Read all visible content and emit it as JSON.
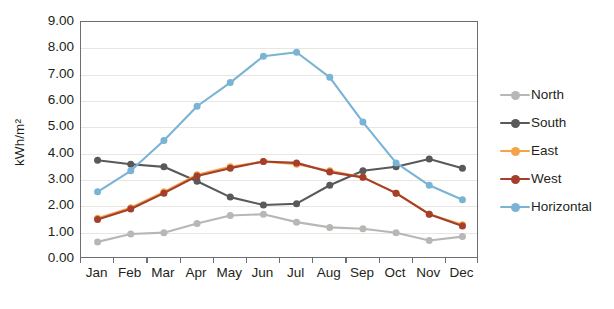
{
  "chart_data": {
    "type": "line",
    "title": "",
    "subtitle": "",
    "xlabel": "",
    "ylabel": "kWh/m²",
    "categories": [
      "Jan",
      "Feb",
      "Mar",
      "Apr",
      "May",
      "Jun",
      "Jul",
      "Aug",
      "Sep",
      "Oct",
      "Nov",
      "Dec"
    ],
    "ylim": [
      0,
      9
    ],
    "ytick_step": 1,
    "ytick_labels": [
      "9.00",
      "8.00",
      "7.00",
      "6.00",
      "5.00",
      "4.00",
      "3.00",
      "2.00",
      "1.00",
      "0.00"
    ],
    "ytick_values": [
      9,
      8,
      7,
      6,
      5,
      4,
      3,
      2,
      1,
      0
    ],
    "grid": true,
    "grid_axis": "y",
    "legend_position": "right",
    "markers": "circle",
    "series": [
      {
        "name": "North",
        "color": "#b7b7b5",
        "values": [
          0.65,
          0.95,
          1.0,
          1.35,
          1.65,
          1.7,
          1.4,
          1.2,
          1.15,
          1.0,
          0.7,
          0.85
        ]
      },
      {
        "name": "South",
        "color": "#58595b",
        "values": [
          3.75,
          3.6,
          3.5,
          2.95,
          2.35,
          2.05,
          2.1,
          2.8,
          3.35,
          3.5,
          3.8,
          3.45
        ]
      },
      {
        "name": "East",
        "color": "#f5a34a",
        "values": [
          1.55,
          1.95,
          2.55,
          3.2,
          3.5,
          3.7,
          3.6,
          3.35,
          3.1,
          2.5,
          1.7,
          1.3
        ]
      },
      {
        "name": "West",
        "color": "#a33f2a",
        "values": [
          1.5,
          1.9,
          2.5,
          3.15,
          3.45,
          3.7,
          3.65,
          3.3,
          3.1,
          2.5,
          1.7,
          1.25
        ]
      },
      {
        "name": "Horizontal",
        "color": "#79b4d4",
        "values": [
          2.55,
          3.35,
          4.5,
          5.8,
          6.7,
          7.7,
          7.85,
          6.9,
          5.2,
          3.65,
          2.8,
          2.25
        ]
      }
    ]
  },
  "caption_sliver": ""
}
